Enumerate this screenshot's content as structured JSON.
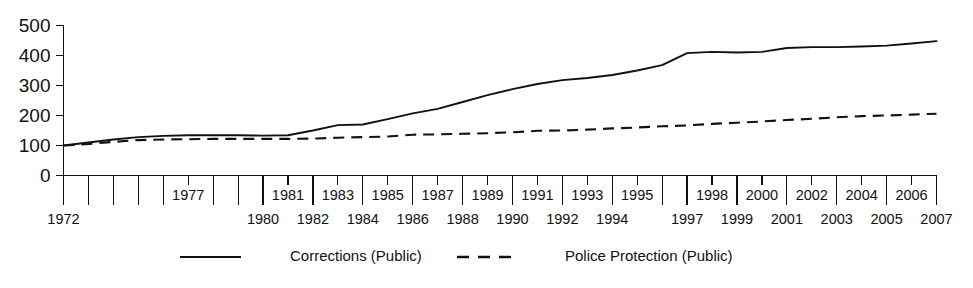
{
  "chart_data": {
    "type": "line",
    "title": "",
    "subtitle": "",
    "xlabel": "",
    "ylabel": "",
    "ylim": [
      0,
      500
    ],
    "yticks": [
      0,
      100,
      200,
      300,
      400,
      500
    ],
    "ytick_labels": [
      "0",
      "100",
      "200",
      "300",
      "400",
      "500"
    ],
    "grid": false,
    "legend_position": "bottom",
    "x": [
      1972,
      1973,
      1974,
      1975,
      1976,
      1977,
      1978,
      1979,
      1980,
      1981,
      1982,
      1983,
      1984,
      1985,
      1986,
      1987,
      1988,
      1989,
      1990,
      1991,
      1992,
      1993,
      1994,
      1995,
      1996,
      1997,
      1998,
      1999,
      2000,
      2001,
      2002,
      2003,
      2004,
      2005,
      2006,
      2007
    ],
    "x_labels_top": [
      "1977",
      "1981",
      "1983",
      "1985",
      "1987",
      "1989",
      "1991",
      "1993",
      "1995",
      "1998",
      "2000",
      "2002",
      "2004",
      "2006"
    ],
    "x_labels_bottom": [
      "1972",
      "1980",
      "1982",
      "1984",
      "1986",
      "1988",
      "1990",
      "1992",
      "1994",
      "1997",
      "1999",
      "2001",
      "2003",
      "2005",
      "2007"
    ],
    "x_tick_values_top": [
      1977,
      1981,
      1983,
      1985,
      1987,
      1989,
      1991,
      1993,
      1995,
      1998,
      2000,
      2002,
      2004,
      2006
    ],
    "x_tick_values_bottom": [
      1972,
      1980,
      1982,
      1984,
      1986,
      1988,
      1990,
      1992,
      1994,
      1997,
      1999,
      2001,
      2003,
      2005,
      2007
    ],
    "series": [
      {
        "name": "Corrections (Public)",
        "style": "solid",
        "color": "#111111",
        "values": [
          100,
          110,
          120,
          128,
          132,
          134,
          134,
          134,
          133,
          134,
          150,
          168,
          170,
          188,
          207,
          222,
          245,
          268,
          288,
          305,
          318,
          325,
          335,
          350,
          368,
          408,
          412,
          410,
          412,
          425,
          428,
          428,
          430,
          433,
          440,
          448
        ]
      },
      {
        "name": "Police Protection (Public)",
        "style": "dashed",
        "color": "#111111",
        "values": [
          100,
          105,
          112,
          118,
          120,
          121,
          122,
          122,
          122,
          122,
          123,
          126,
          128,
          130,
          136,
          137,
          139,
          141,
          144,
          149,
          150,
          153,
          157,
          160,
          164,
          167,
          172,
          176,
          180,
          185,
          189,
          194,
          198,
          200,
          203,
          206
        ]
      }
    ],
    "legend": [
      {
        "label": "Corrections (Public)",
        "style": "solid"
      },
      {
        "label": "Police Protection (Public)",
        "style": "dashed"
      }
    ]
  }
}
